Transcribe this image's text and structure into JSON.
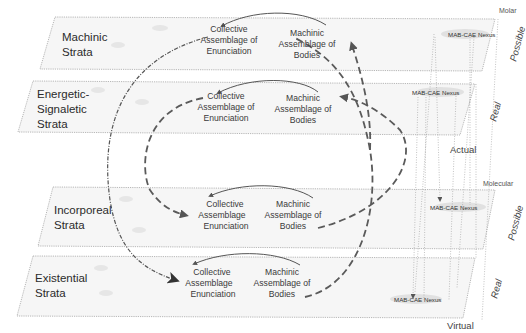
{
  "corner_labels": {
    "molar": "Molar",
    "molecular": "Molecular",
    "actual": "Actual",
    "virtual": "Virtual"
  },
  "side_labels": {
    "machinic": "Possible",
    "energetic": "Real",
    "incorporeal": "Possible",
    "existential": "Real"
  },
  "strata": [
    {
      "name_lines": [
        "Machinic",
        "Strata"
      ],
      "cae_lines": [
        "Collective",
        "Assemblage of",
        "Enunciation"
      ],
      "mab_lines": [
        "Machinic",
        "Assemblage of",
        "Bodies"
      ],
      "nexus": "MAB-CAE Nexus"
    },
    {
      "name_lines": [
        "Energetic-",
        "Signaletic",
        "Strata"
      ],
      "cae_lines": [
        "Collective",
        "Assemblage of",
        "Enunciation"
      ],
      "mab_lines": [
        "Machinic",
        "Assemblage of",
        "Bodies"
      ],
      "nexus": "MAB-CAE Nexus"
    },
    {
      "name_lines": [
        "Incorporeal",
        "Strata"
      ],
      "cae_lines": [
        "Collective",
        "Assemblage",
        "Enunciation"
      ],
      "mab_lines": [
        "Machinic",
        "Assemblage of",
        "Bodies"
      ],
      "nexus": "MAB-CAE Nexus"
    },
    {
      "name_lines": [
        "Existential",
        "Strata"
      ],
      "cae_lines": [
        "Collective",
        "Assemblage",
        "Enunciation"
      ],
      "mab_lines": [
        "Machinic",
        "Assemblage of",
        "Bodies"
      ],
      "nexus": "MAB-CAE Nexus"
    }
  ]
}
